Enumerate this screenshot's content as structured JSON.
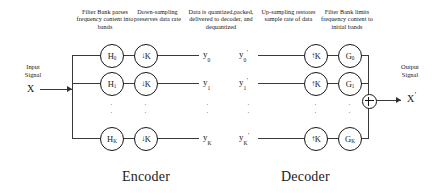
{
  "diagram": {
    "title_left": "Encoder",
    "title_right": "Decoder",
    "annotations": {
      "filter_bank_analysis": "Filter Bank parses frequency content into bands",
      "downsampling": "Down-sampling preserves data rate",
      "quantization": "Data is quantized,packed, delivered to decoder, and dequantized",
      "upsampling": "Up-sampling restores sample rate of data",
      "filter_bank_synthesis": "Filter Bank limits frequency content to initial bands"
    },
    "input": {
      "line1": "Input",
      "line2": "Signal",
      "symbol": "X"
    },
    "output": {
      "line1": "Output",
      "line2": "Signal",
      "symbol": "X",
      "prime": "'"
    },
    "encoder": {
      "analysis_filters": [
        "H",
        "H",
        "H"
      ],
      "analysis_filter_subs": [
        "0",
        "1",
        "K"
      ],
      "downsamplers": [
        "K",
        "K",
        "K"
      ],
      "downsample_arrow": "↓",
      "outputs": [
        "y",
        "y",
        "y"
      ],
      "output_subs": [
        "0",
        "1",
        "K"
      ]
    },
    "decoder": {
      "inputs": [
        "y",
        "y",
        "y"
      ],
      "input_subs": [
        "0",
        "1",
        "K"
      ],
      "input_prime": "'",
      "upsamplers": [
        "K",
        "K",
        "K"
      ],
      "upsample_arrow": "↑",
      "synthesis_filters": [
        "G",
        "G",
        "G"
      ],
      "synthesis_filter_subs": [
        "0",
        "1",
        "K"
      ],
      "adder": "+"
    },
    "ellipsis": "·",
    "colors": {
      "line": "#3a3a3a",
      "stroke": "#161616",
      "text": "#141414",
      "bg": "#ffffff"
    }
  }
}
